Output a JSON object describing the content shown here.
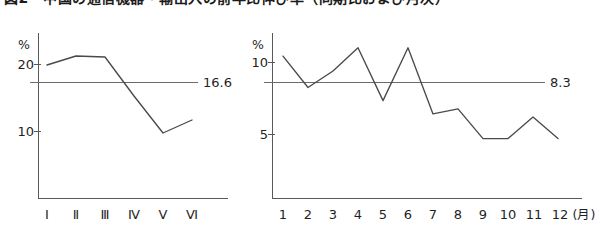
{
  "caption": {
    "text": "図2　中国の通信機器・輸出入の前年比伸び率（同期比および月次）",
    "visible_note": "top caption row is cropped by the image edge"
  },
  "figure_left": {
    "name": "half-year-chart"
  },
  "figure_right": {
    "name": "monthly-chart"
  },
  "chart_data": [
    {
      "type": "line",
      "name": "left-chart",
      "title": "",
      "xlabel": "",
      "ylabel": "%",
      "unit_label": "%",
      "categories": [
        "Ⅰ",
        "Ⅱ",
        "Ⅲ",
        "Ⅳ",
        "Ⅴ",
        "Ⅵ"
      ],
      "values": [
        19.3,
        20.2,
        20.1,
        16.2,
        12.5,
        13.8
      ],
      "ytick_labels": [
        "20",
        "10"
      ],
      "ytick_values": [
        20,
        10
      ],
      "ylim": [
        6.0,
        22.5
      ],
      "reference_line": {
        "label": "16.6",
        "value": 16.6
      },
      "grid": false,
      "legend": "none"
    },
    {
      "type": "line",
      "name": "right-chart",
      "title": "",
      "xlabel": "(月)",
      "ylabel": "%",
      "unit_label": "%",
      "categories": [
        "1",
        "2",
        "3",
        "4",
        "5",
        "6",
        "7",
        "8",
        "9",
        "10",
        "11",
        "12"
      ],
      "x_axis_suffix": "(月)",
      "values": [
        11.0,
        9.1,
        10.1,
        11.5,
        8.3,
        11.5,
        7.5,
        7.8,
        6.0,
        6.0,
        7.3,
        6.0
      ],
      "ytick_labels": [
        "10",
        "5"
      ],
      "ytick_values": [
        10,
        5
      ],
      "ylim": [
        2.4,
        12.4
      ],
      "reference_line": {
        "label": "8.3",
        "value": 8.3
      },
      "grid": false,
      "legend": "none"
    }
  ],
  "colors": {
    "data_line": "#4a4a4a",
    "axis": "#595959",
    "reference_line": "#6b6b6b",
    "text": "#1f1f1f",
    "background": "#ffffff"
  }
}
